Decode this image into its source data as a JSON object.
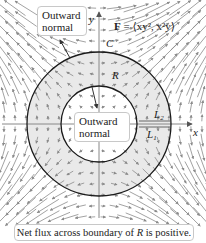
{
  "figure": {
    "field_label_prefix": "F",
    "field_label_rest": " = ⟨xy², x²y⟩",
    "axis_x_label": "x",
    "axis_y_label": "y",
    "curve_label": "C",
    "region_label": "R",
    "segment_upper_label": "L",
    "segment_upper_sub": "2",
    "segment_lower_label": "L",
    "segment_lower_sub": "1",
    "outer_callout_line1": "Outward",
    "outer_callout_line2": "normal",
    "inner_callout_line1": "Outward",
    "inner_callout_line2": "normal",
    "caption": "Net flux across boundary of R is positive.",
    "caption_prefix": "Net flux across boundary of ",
    "caption_italic": "R",
    "caption_suffix": " is positive.",
    "colors": {
      "region_fill": "#e9e9e9",
      "circle_stroke": "#1a1a1a",
      "axis_stroke": "#888888",
      "arrow_stroke": "#8a8a8a",
      "callout_border": "#c8c8c8"
    },
    "geometry": {
      "center": [
        99,
        124
      ],
      "outer_radius": 72,
      "inner_radius": 38
    }
  }
}
